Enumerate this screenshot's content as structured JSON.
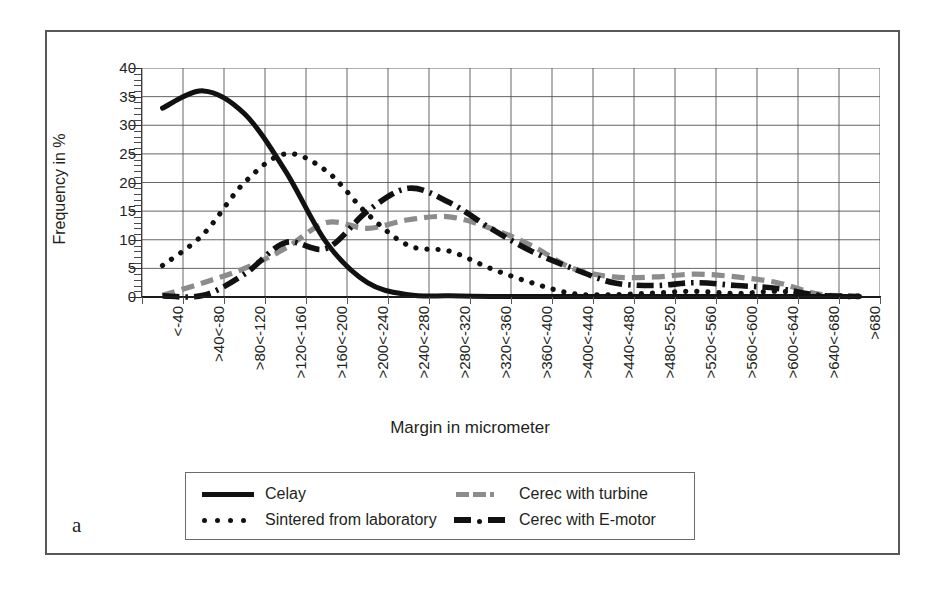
{
  "figure": {
    "label": "a",
    "x_axis_title": "Margin in micrometer",
    "y_axis_title": "Frequency in %"
  },
  "legend": {
    "items": [
      {
        "label": "Celay",
        "style": "solid",
        "color": "#111111"
      },
      {
        "label": "Sintered from laboratory",
        "style": "dotted",
        "color": "#111111"
      },
      {
        "label": "Cerec with turbine",
        "style": "dashed",
        "color": "#8c8c8e"
      },
      {
        "label": "Cerec with E-motor",
        "style": "dashdot",
        "color": "#111111"
      }
    ]
  },
  "chart_data": {
    "type": "line",
    "title": "",
    "xlabel": "Margin in micrometer",
    "ylabel": "Frequency in %",
    "ylim": [
      0,
      40
    ],
    "ytick_step": 5,
    "yticks": [
      0,
      5,
      10,
      15,
      20,
      25,
      30,
      35,
      40
    ],
    "ytick_labels": [
      "0",
      "5",
      "10",
      "15",
      "20",
      "25",
      "30",
      "35",
      "40"
    ],
    "grid": true,
    "legend_position": "bottom",
    "categories": [
      "<-40",
      ">40<-80",
      ">80<-120",
      ">120<-160",
      ">160<-200",
      ">200<-240",
      ">240<-280",
      ">280<-320",
      ">320<-360",
      ">360<-400",
      ">400<-440",
      ">440<-480",
      ">480<-520",
      ">520<-560",
      ">560<-600",
      ">600<-640",
      ">640<-680",
      ">680"
    ],
    "series": [
      {
        "name": "Celay",
        "style": "solid",
        "color": "#111111",
        "values": [
          33,
          36,
          32,
          22,
          9.5,
          2.5,
          0.4,
          0.2,
          0.1,
          0.1,
          0.1,
          0.1,
          0.1,
          0.1,
          0.1,
          0.1,
          0.1,
          0.1
        ]
      },
      {
        "name": "Sintered from laboratory",
        "style": "dotted",
        "color": "#111111",
        "values": [
          5.5,
          11,
          20,
          25,
          22,
          14.5,
          9,
          8,
          5,
          2.5,
          0.6,
          0.4,
          0.7,
          1,
          0.6,
          1,
          0.3,
          0.1
        ]
      },
      {
        "name": "Cerec with turbine",
        "style": "dashed",
        "color": "#8c8c8e",
        "values": [
          0.3,
          2.5,
          5,
          8.5,
          13,
          12,
          13.5,
          14,
          12,
          9,
          5,
          3.5,
          3.5,
          4,
          3.5,
          2.5,
          0.5,
          0.2
        ]
      },
      {
        "name": "Cerec with E-motor",
        "style": "dashdot",
        "color": "#111111",
        "values": [
          0.2,
          0.3,
          4,
          9.5,
          8.5,
          15,
          19,
          16.5,
          12,
          8,
          5,
          2.5,
          2,
          2.5,
          2,
          1.5,
          0.3,
          0.1
        ]
      }
    ]
  }
}
